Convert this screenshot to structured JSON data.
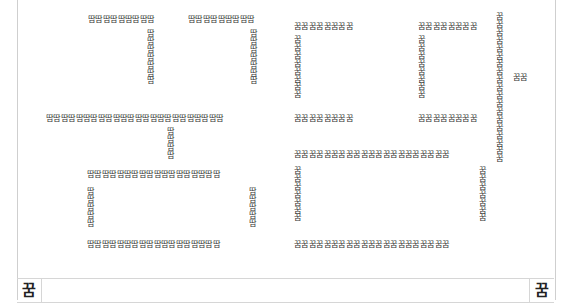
{
  "document": {
    "left_glyph": "땀",
    "right_glyph": "꿈",
    "left_art": {
      "tt_top_a": "땀땀땀땀땀땀땀땀땀",
      "tt_top_b": "땀땀땀땀땀땀땀땀땀",
      "tt_vert_a": "땀땀땀땀땀땀땀",
      "tt_vert_b": "땀땀땀땀땀땀땀",
      "a_bar": "땀땀땀땀땀땀땀땀땀땀땀땀땀땀땀땀땀땀땀땀땀땀땀땀",
      "a_stem": "땀땀땀땀",
      "m_top": "땀땀땀땀땀땀땀땀땀땀땀땀땀땀땀땀땀땀",
      "m_left": "땀땀땀땀땀",
      "m_right": "땀땀땀땀땀",
      "m_bottom": "땀땀땀땀땀땀땀땀땀땀땀땀땀땀땀땀땀땀"
    },
    "right_art": {
      "kk1_top": "꿈꿈꿈꿈꿈꿈꿈꿈",
      "kk1_left": "꿈꿈꿈꿈꿈꿈꿈꿈",
      "kk1_bottom": "꿈꿈꿈꿈꿈꿈꿈꿈",
      "kk2_top": "꿈꿈꿈꿈꿈꿈꿈꿈",
      "kk2_left": "꿈꿈꿈꿈꿈꿈꿈꿈",
      "kk2_bottom": "꿈꿈꿈꿈꿈꿈꿈꿈",
      "u_vertical": "꿈꿈꿈꿈꿈꿈꿈꿈꿈꿈꿈꿈꿈꿈꿈꿈꿈꿈꿈",
      "u_side": "꿈꿈",
      "m_top": "꿈꿈꿈꿈꿈꿈꿈꿈꿈꿈꿈꿈꿈꿈꿈꿈꿈꿈꿈꿈꿈",
      "m_left": "꿈꿈꿈꿈꿈꿈꿈",
      "m_right": "꿈꿈꿈꿈꿈꿈꿈",
      "m_bottom": "꿈꿈꿈꿈꿈꿈꿈꿈꿈꿈꿈꿈꿈꿈꿈꿈꿈꿈꿈꿈꿈"
    },
    "footer": {
      "left_cell": "꿈",
      "right_cell": "꿈"
    }
  }
}
